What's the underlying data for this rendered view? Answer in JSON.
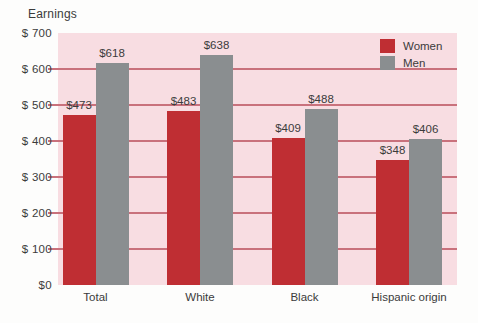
{
  "chart_data": {
    "type": "bar",
    "title": "Earnings",
    "categories": [
      "Total",
      "White",
      "Black",
      "Hispanic origin"
    ],
    "series": [
      {
        "name": "Women",
        "color": "#bf2e33",
        "values": [
          473,
          483,
          409,
          348
        ],
        "value_labels": [
          "$473",
          "$483",
          "$409",
          "$348"
        ]
      },
      {
        "name": "Men",
        "color": "#8a8e90",
        "values": [
          618,
          638,
          488,
          406
        ],
        "value_labels": [
          "$618",
          "$638",
          "$488",
          "$406"
        ]
      }
    ],
    "xlabel": "",
    "ylabel": "Earnings",
    "ylim": [
      0,
      700
    ],
    "grid": true,
    "legend": {
      "position": "top-right",
      "entries": [
        "Women",
        "Men"
      ]
    },
    "yticks": [
      {
        "value": 700,
        "label": "$ 700"
      },
      {
        "value": 600,
        "label": "$ 600"
      },
      {
        "value": 500,
        "label": "$ 500"
      },
      {
        "value": 400,
        "label": "$ 400"
      },
      {
        "value": 300,
        "label": "$ 300"
      },
      {
        "value": 200,
        "label": "$ 200"
      },
      {
        "value": 100,
        "label": "$ 100"
      },
      {
        "value": 0,
        "label": "$0"
      }
    ],
    "colors": {
      "plot_background": "#f8dde2",
      "gridline": "#c9717c",
      "women": "#bf2e33",
      "men": "#8a8e90",
      "text": "#3b3b3b"
    }
  }
}
